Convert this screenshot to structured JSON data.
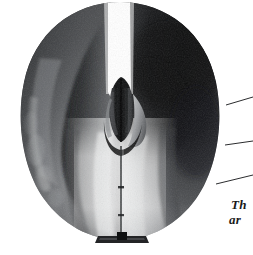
{
  "figure": {
    "kind": "photograph",
    "background_color": "#ffffff",
    "width": 253,
    "height": 255
  },
  "object": {
    "name": "nozzle-shell",
    "silhouette": "rounded teardrop / inverted pear outline, flat-ish bottom",
    "body_dark": "#17181a",
    "body_mid": "#54565a",
    "body_light": "#b9bbbd",
    "highlight": "#e6e7e8",
    "slot_color": "#ffffff",
    "center_x": 120,
    "center_y": 128
  },
  "parts": {
    "left_blade": "left duct half, dark with diagonal sheen",
    "right_blade": "right duct half, darkest region upper right",
    "top_slot": "white vertical wedge gap between the two halves",
    "hub": "central cylindrical hub with pointed nose and dark split line",
    "seam": "vertical parting seam running from hub to base",
    "base_foot": "small dark mounting foot at bottom center"
  },
  "annotations": {
    "leader_lines": [
      {
        "name": "leader-line-top",
        "x1": 226,
        "y1": 105,
        "x2": 253,
        "y2": 97
      },
      {
        "name": "leader-line-middle",
        "x1": 225,
        "y1": 145,
        "x2": 253,
        "y2": 141
      },
      {
        "name": "leader-line-bottom",
        "x1": 216,
        "y1": 184,
        "x2": 253,
        "y2": 175
      }
    ],
    "caption": {
      "line_1": "Th",
      "line_2": "ar",
      "note": "italic caption clipped at right image edge"
    }
  }
}
